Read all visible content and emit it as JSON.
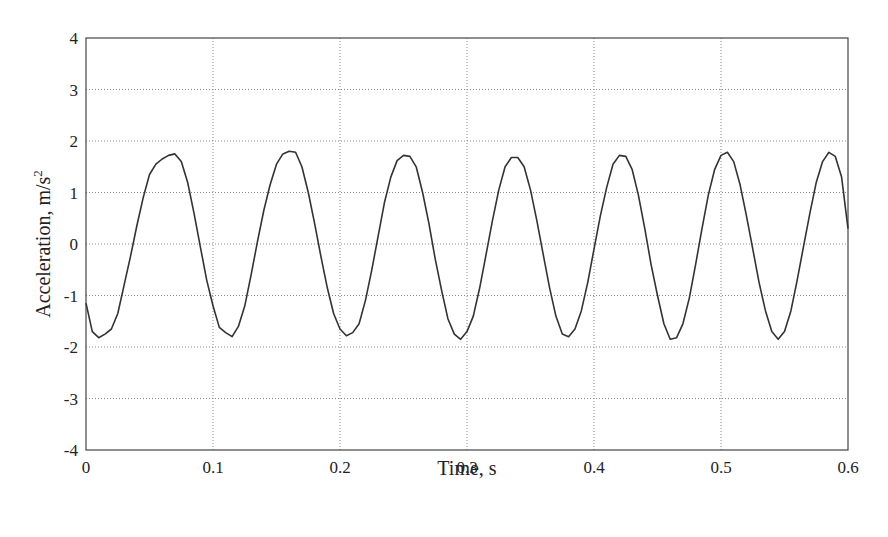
{
  "chart_data": {
    "type": "line",
    "title": "",
    "xlabel": "Time, s",
    "ylabel": "Acceleration, m/s",
    "ylabel_superscript": "2",
    "xlim": [
      0,
      0.6
    ],
    "ylim": [
      -4,
      4
    ],
    "xticks": [
      0,
      0.1,
      0.2,
      0.3,
      0.4,
      0.5,
      0.6
    ],
    "xtick_labels": [
      "0",
      "0.1",
      "0.2",
      "0.3",
      "0.4",
      "0.5",
      "0.6"
    ],
    "yticks": [
      -4,
      -3,
      -2,
      -1,
      0,
      1,
      2,
      3,
      4
    ],
    "ytick_labels": [
      "-4",
      "-3",
      "-2",
      "-1",
      "0",
      "1",
      "2",
      "3",
      "4"
    ],
    "grid": true,
    "legend": null,
    "series": [
      {
        "name": "acceleration",
        "color": "#333333",
        "description": "Approximately sinusoidal signal, ~10 Hz, amplitude ~1.8 m/s^2",
        "x": [
          0.0,
          0.005,
          0.01,
          0.015,
          0.02,
          0.025,
          0.03,
          0.035,
          0.04,
          0.045,
          0.05,
          0.055,
          0.06,
          0.065,
          0.07,
          0.075,
          0.08,
          0.085,
          0.09,
          0.095,
          0.1,
          0.105,
          0.11,
          0.115,
          0.12,
          0.125,
          0.13,
          0.135,
          0.14,
          0.145,
          0.15,
          0.155,
          0.16,
          0.165,
          0.17,
          0.175,
          0.18,
          0.185,
          0.19,
          0.195,
          0.2,
          0.205,
          0.21,
          0.215,
          0.22,
          0.225,
          0.23,
          0.235,
          0.24,
          0.245,
          0.25,
          0.255,
          0.26,
          0.265,
          0.27,
          0.275,
          0.28,
          0.285,
          0.29,
          0.295,
          0.3,
          0.305,
          0.31,
          0.315,
          0.32,
          0.325,
          0.33,
          0.335,
          0.34,
          0.345,
          0.35,
          0.355,
          0.36,
          0.365,
          0.37,
          0.375,
          0.38,
          0.385,
          0.39,
          0.395,
          0.4,
          0.405,
          0.41,
          0.415,
          0.42,
          0.425,
          0.43,
          0.435,
          0.44,
          0.445,
          0.45,
          0.455,
          0.46,
          0.465,
          0.47,
          0.475,
          0.48,
          0.485,
          0.49,
          0.495,
          0.5,
          0.505,
          0.51,
          0.515,
          0.52,
          0.525,
          0.53,
          0.535,
          0.54,
          0.545,
          0.55,
          0.555,
          0.56,
          0.565,
          0.57,
          0.575,
          0.58,
          0.585,
          0.59,
          0.595,
          0.6
        ],
        "y": [
          -1.15,
          -1.7,
          -1.82,
          -1.75,
          -1.65,
          -1.35,
          -0.8,
          -0.25,
          0.35,
          0.9,
          1.35,
          1.55,
          1.65,
          1.72,
          1.75,
          1.6,
          1.2,
          0.6,
          -0.05,
          -0.7,
          -1.2,
          -1.62,
          -1.72,
          -1.8,
          -1.6,
          -1.2,
          -0.6,
          0.05,
          0.65,
          1.15,
          1.55,
          1.75,
          1.8,
          1.78,
          1.5,
          1.0,
          0.4,
          -0.25,
          -0.85,
          -1.35,
          -1.65,
          -1.78,
          -1.72,
          -1.55,
          -1.1,
          -0.5,
          0.15,
          0.8,
          1.3,
          1.62,
          1.72,
          1.7,
          1.5,
          1.0,
          0.4,
          -0.3,
          -0.9,
          -1.45,
          -1.75,
          -1.85,
          -1.7,
          -1.4,
          -0.85,
          -0.2,
          0.45,
          1.05,
          1.5,
          1.68,
          1.68,
          1.5,
          1.05,
          0.45,
          -0.2,
          -0.85,
          -1.4,
          -1.75,
          -1.8,
          -1.65,
          -1.3,
          -0.75,
          -0.1,
          0.55,
          1.1,
          1.55,
          1.72,
          1.7,
          1.45,
          0.95,
          0.3,
          -0.4,
          -1.0,
          -1.55,
          -1.85,
          -1.82,
          -1.55,
          -1.05,
          -0.4,
          0.3,
          0.95,
          1.45,
          1.72,
          1.78,
          1.6,
          1.15,
          0.55,
          -0.1,
          -0.75,
          -1.3,
          -1.7,
          -1.85,
          -1.7,
          -1.3,
          -0.7,
          -0.05,
          0.6,
          1.2,
          1.6,
          1.78,
          1.7,
          1.3,
          0.3
        ]
      }
    ]
  }
}
